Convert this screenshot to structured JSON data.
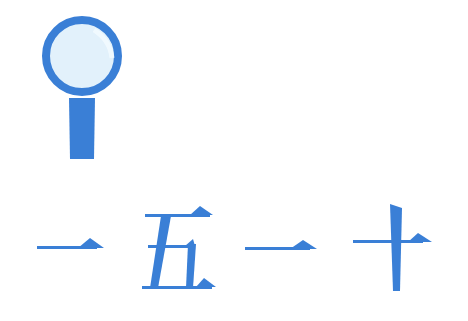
{
  "illustration": {
    "icon": "magnifying-glass-icon",
    "colors": {
      "primary": "#3a7fd6",
      "lens": "#e2f1fb"
    }
  },
  "phrase": {
    "text": "一五一十",
    "characters": [
      "一",
      "五",
      "一",
      "十"
    ]
  }
}
